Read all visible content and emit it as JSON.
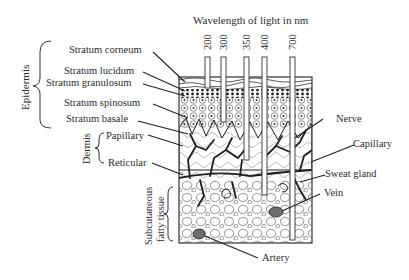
{
  "title": "Wavelength of light in nm",
  "wavelengths": [
    {
      "label": "200",
      "x": 207,
      "depth": 88
    },
    {
      "label": "300",
      "x": 223,
      "depth": 122
    },
    {
      "label": "350",
      "x": 246,
      "depth": 160
    },
    {
      "label": "400",
      "x": 265,
      "depth": 195
    },
    {
      "label": "700",
      "x": 292,
      "depth": 240
    }
  ],
  "groups": {
    "epidermis": "Epidermis",
    "dermis": "Dermis",
    "subcutaneous_line1": "Subcutaneous",
    "subcutaneous_line2": "fatty tissue"
  },
  "left_labels": {
    "stratum_corneum": "Stratum corneum",
    "stratum_lucidum": "Stratum lucidum",
    "stratum_granulosum": "Stratum granulosum",
    "stratum_spinosum": "Stratum spinosum",
    "stratum_basale": "Stratum basale",
    "papillary": "Papillary",
    "reticular": "Reticular"
  },
  "right_labels": {
    "nerve": "Nerve",
    "capillary": "Capillary",
    "sweat_gland": "Sweat gland",
    "vein": "Vein",
    "artery": "Artery"
  },
  "colors": {
    "ink": "#2b2b2b",
    "vessel": "#1e1e1e",
    "vein_fill": "#6e6e6e",
    "background": "#ffffff"
  }
}
